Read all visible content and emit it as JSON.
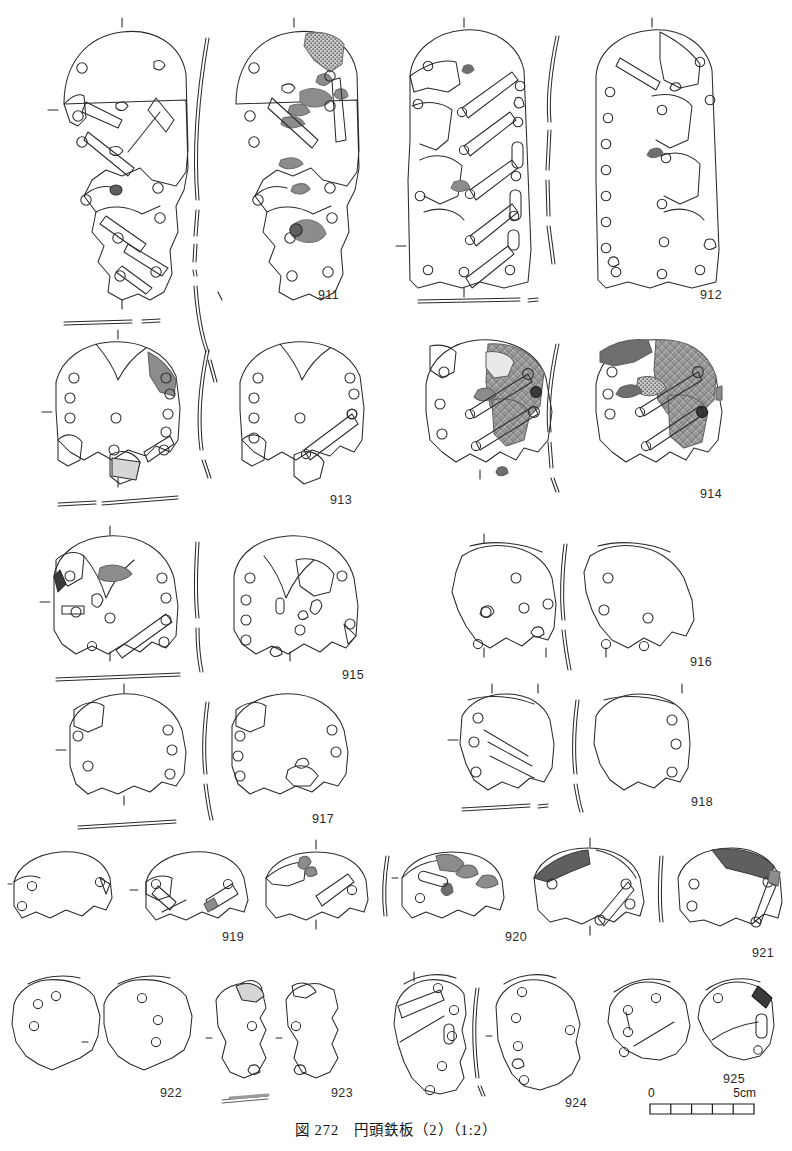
{
  "figure": {
    "caption": "図 272　円頭鉄板（2）（1:2）",
    "caption_number": "図 272",
    "caption_title": "円頭鉄板（2）",
    "caption_scale": "（1:2）",
    "ink_color": "#2b2b2b",
    "shade_color": "#8c8c8c",
    "shade_dark_color": "#5f5f5f"
  },
  "scale_bar": {
    "start_label": "0",
    "end_label": "5cm",
    "divisions": 5,
    "unit": "cm",
    "length_cm": 5
  },
  "objects": [
    {
      "id": "911",
      "label": "911",
      "label_x": 318,
      "label_y": 288
    },
    {
      "id": "912",
      "label": "912",
      "label_x": 700,
      "label_y": 288
    },
    {
      "id": "913",
      "label": "913",
      "label_x": 330,
      "label_y": 493
    },
    {
      "id": "914",
      "label": "914",
      "label_x": 700,
      "label_y": 487
    },
    {
      "id": "915",
      "label": "915",
      "label_x": 342,
      "label_y": 668
    },
    {
      "id": "916",
      "label": "916",
      "label_x": 690,
      "label_y": 655
    },
    {
      "id": "917",
      "label": "917",
      "label_x": 312,
      "label_y": 812
    },
    {
      "id": "918",
      "label": "918",
      "label_x": 691,
      "label_y": 795
    },
    {
      "id": "919",
      "label": "919",
      "label_x": 222,
      "label_y": 930
    },
    {
      "id": "920",
      "label": "920",
      "label_x": 505,
      "label_y": 930
    },
    {
      "id": "921",
      "label": "921",
      "label_x": 752,
      "label_y": 946
    },
    {
      "id": "922",
      "label": "922",
      "label_x": 160,
      "label_y": 1086
    },
    {
      "id": "923",
      "label": "923",
      "label_x": 331,
      "label_y": 1086
    },
    {
      "id": "924",
      "label": "924",
      "label_x": 565,
      "label_y": 1096
    },
    {
      "id": "925",
      "label": "925",
      "label_x": 723,
      "label_y": 1072
    }
  ]
}
